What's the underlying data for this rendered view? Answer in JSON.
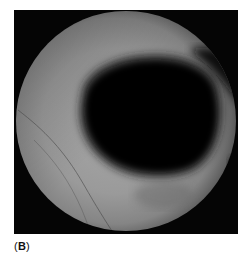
{
  "figure": {
    "panel_label_open": "(",
    "panel_label_letter": "B",
    "panel_label_close": ")",
    "colors": {
      "background_frame": "#050505",
      "ring_light": "#9a9a9a",
      "ring_mid": "#7a7a7a",
      "cavity": "#060606",
      "page": "#ffffff"
    }
  }
}
